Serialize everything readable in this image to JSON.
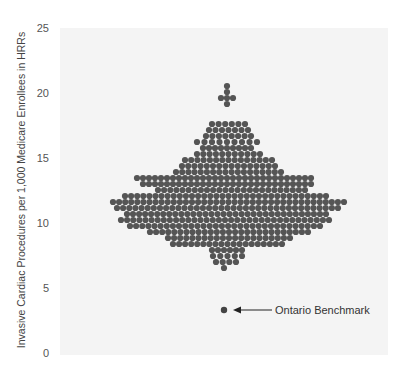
{
  "chart_data": {
    "type": "scatter",
    "subtype": "beeswarm",
    "title": "",
    "xlabel": "",
    "ylabel": "Invasive Cardiac Procedures per 1,000 Medicare Enrollees in HRRs",
    "ylim": [
      0,
      25
    ],
    "yticks": [
      "0",
      "5",
      "10",
      "15",
      "20",
      "25"
    ],
    "grid": false,
    "legend": null,
    "colors": {
      "dots": "#555555",
      "panel": "#f4f4f4",
      "benchmark": "#444444"
    },
    "rows": [
      {
        "value": 20.6,
        "count": 1
      },
      {
        "value": 20.1,
        "count": 1
      },
      {
        "value": 19.6,
        "count": 3
      },
      {
        "value": 19.1,
        "count": 1
      },
      {
        "value": 17.6,
        "count": 6
      },
      {
        "value": 17.1,
        "count": 7
      },
      {
        "value": 16.6,
        "count": 8
      },
      {
        "value": 16.1,
        "count": 9
      },
      {
        "value": 15.6,
        "count": 9
      },
      {
        "value": 15.1,
        "count": 11
      },
      {
        "value": 14.6,
        "count": 15
      },
      {
        "value": 14.2,
        "count": 16
      },
      {
        "value": 13.7,
        "count": 18
      },
      {
        "value": 13.2,
        "count": 30
      },
      {
        "value": 12.7,
        "count": 29
      },
      {
        "value": 12.2,
        "count": 25
      },
      {
        "value": 11.7,
        "count": 34
      },
      {
        "value": 11.2,
        "count": 39
      },
      {
        "value": 10.7,
        "count": 37
      },
      {
        "value": 10.2,
        "count": 34
      },
      {
        "value": 9.7,
        "count": 35
      },
      {
        "value": 9.3,
        "count": 32
      },
      {
        "value": 8.8,
        "count": 27
      },
      {
        "value": 8.3,
        "count": 21
      },
      {
        "value": 7.8,
        "count": 19
      },
      {
        "value": 7.3,
        "count": 6
      },
      {
        "value": 6.8,
        "count": 5
      },
      {
        "value": 6.3,
        "count": 4
      },
      {
        "value": 5.9,
        "count": 1
      }
    ],
    "annotations": [
      {
        "label": "Ontario Benchmark",
        "value": 3.3,
        "arrow": true
      }
    ]
  },
  "labels": {
    "ylabel": "Invasive Cardiac Procedures per 1,000 Medicare Enrollees in HRRs",
    "benchmark": "Ontario Benchmark",
    "ticks": [
      "0",
      "5",
      "10",
      "15",
      "20",
      "25"
    ]
  }
}
